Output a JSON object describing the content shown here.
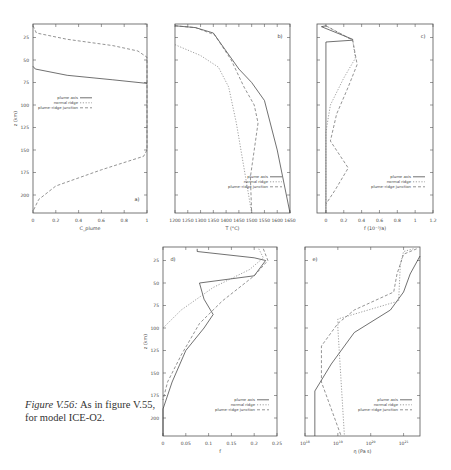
{
  "caption": {
    "label": "Figure V.56:",
    "text": "As in figure V.55, for model ICE-O2."
  },
  "legend": [
    "plume axis",
    "normal ridge",
    "plume–ridge junction"
  ],
  "chart_data": [
    {
      "id": "a",
      "panel_label": "a)",
      "type": "line",
      "xlabel": "C_plume",
      "ylabel": "z (km)",
      "xlim": [
        0,
        1
      ],
      "ylim": [
        10,
        220
      ],
      "y_inverted": true,
      "xticks": [
        "0",
        "0.2",
        "0.4",
        "0.6",
        "0.8",
        "1"
      ],
      "yticks": [
        "25",
        "50",
        "75",
        "100",
        "125",
        "150",
        "175",
        "200"
      ],
      "series": [
        {
          "name": "plume axis",
          "style": "solid",
          "points": [
            [
              0,
              57
            ],
            [
              0.02,
              60
            ],
            [
              0.3,
              67
            ],
            [
              0.7,
              72
            ],
            [
              1,
              76
            ]
          ]
        },
        {
          "name": "normal ridge",
          "style": "dotted",
          "points": [
            [
              0.98,
              0
            ],
            [
              1,
              0
            ]
          ]
        },
        {
          "name": "plume–ridge junction",
          "style": "dashed",
          "points": [
            [
              0,
              12
            ],
            [
              0.03,
              20
            ],
            [
              0.3,
              27
            ],
            [
              0.7,
              34
            ],
            [
              0.92,
              40
            ],
            [
              1,
              47
            ],
            [
              1,
              150
            ],
            [
              0.97,
              157
            ],
            [
              0.6,
              172
            ],
            [
              0.2,
              190
            ],
            [
              0.05,
              205
            ],
            [
              0,
              218
            ]
          ]
        }
      ]
    },
    {
      "id": "b",
      "panel_label": "b)",
      "type": "line",
      "xlabel": "T (°C)",
      "ylabel": "",
      "xlim": [
        1200,
        1650
      ],
      "ylim": [
        10,
        220
      ],
      "y_inverted": true,
      "xticks": [
        "1200",
        "1250",
        "1300",
        "1350",
        "1400",
        "1450",
        "1500",
        "1550",
        "1600",
        "1650"
      ],
      "series": [
        {
          "name": "plume axis",
          "style": "solid",
          "points": [
            [
              1200,
              12
            ],
            [
              1280,
              14
            ],
            [
              1350,
              20
            ],
            [
              1400,
              40
            ],
            [
              1450,
              60
            ],
            [
              1500,
              75
            ],
            [
              1550,
              95
            ],
            [
              1600,
              150
            ],
            [
              1650,
              220
            ]
          ]
        },
        {
          "name": "normal ridge",
          "style": "dotted",
          "points": [
            [
              1200,
              33
            ],
            [
              1300,
              45
            ],
            [
              1370,
              58
            ],
            [
              1410,
              80
            ],
            [
              1440,
              120
            ],
            [
              1470,
              170
            ],
            [
              1500,
              220
            ]
          ]
        },
        {
          "name": "plume–ridge junction",
          "style": "dashed",
          "points": [
            [
              1200,
              12
            ],
            [
              1280,
              14
            ],
            [
              1355,
              22
            ],
            [
              1420,
              50
            ],
            [
              1470,
              80
            ],
            [
              1510,
              100
            ],
            [
              1525,
              120
            ],
            [
              1510,
              150
            ],
            [
              1495,
              180
            ],
            [
              1500,
              220
            ]
          ]
        }
      ]
    },
    {
      "id": "c",
      "panel_label": "c)",
      "type": "line",
      "xlabel": "f (10⁻³/a)",
      "ylabel": "",
      "xlim": [
        -0.1,
        1.2
      ],
      "ylim": [
        10,
        220
      ],
      "y_inverted": true,
      "xticks": [
        "0",
        "0.2",
        "0.4",
        "0.6",
        "0.8",
        "1",
        "1.2"
      ],
      "series": [
        {
          "name": "plume axis",
          "style": "solid",
          "points": [
            [
              0,
              12
            ],
            [
              -0.05,
              13
            ],
            [
              0.3,
              27
            ],
            [
              0.3,
              28
            ],
            [
              0,
              30
            ],
            [
              0,
              220
            ]
          ]
        },
        {
          "name": "normal ridge",
          "style": "dotted",
          "points": [
            [
              0,
              12
            ],
            [
              0.3,
              28
            ],
            [
              0.33,
              48
            ],
            [
              0.2,
              70
            ],
            [
              0.05,
              100
            ],
            [
              0,
              130
            ],
            [
              0,
              220
            ]
          ]
        },
        {
          "name": "plume–ridge junction",
          "style": "dashed",
          "points": [
            [
              0,
              12
            ],
            [
              0.3,
              28
            ],
            [
              0.35,
              55
            ],
            [
              0.25,
              80
            ],
            [
              0.12,
              110
            ],
            [
              0.05,
              140
            ],
            [
              0.25,
              170
            ],
            [
              0.1,
              195
            ],
            [
              0,
              210
            ]
          ]
        }
      ]
    },
    {
      "id": "d",
      "panel_label": "d)",
      "type": "line",
      "xlabel": "f",
      "ylabel": "z (km)",
      "xlim": [
        0,
        0.25
      ],
      "ylim": [
        10,
        220
      ],
      "y_inverted": true,
      "xticks": [
        "0",
        "0.05",
        "0.1",
        "0.15",
        "0.2",
        "0.25"
      ],
      "yticks": [
        "25",
        "50",
        "75",
        "100",
        "125",
        "150",
        "175",
        "200"
      ],
      "series": [
        {
          "name": "plume axis",
          "style": "solid",
          "points": [
            [
              0.075,
              12
            ],
            [
              0.075,
              15
            ],
            [
              0.2,
              22
            ],
            [
              0.225,
              25
            ],
            [
              0.2,
              42
            ],
            [
              0.08,
              50
            ],
            [
              0.09,
              68
            ],
            [
              0.11,
              85
            ],
            [
              0.09,
              100
            ],
            [
              0.05,
              125
            ],
            [
              0.02,
              160
            ],
            [
              0,
              190
            ],
            [
              0,
              220
            ]
          ]
        },
        {
          "name": "normal ridge",
          "style": "dotted",
          "points": [
            [
              0.21,
              12
            ],
            [
              0.22,
              22
            ],
            [
              0.19,
              35
            ],
            [
              0.11,
              55
            ],
            [
              0.04,
              80
            ],
            [
              0,
              100
            ]
          ]
        },
        {
          "name": "plume–ridge junction",
          "style": "dashed",
          "points": [
            [
              0.22,
              12
            ],
            [
              0.23,
              25
            ],
            [
              0.2,
              42
            ],
            [
              0.13,
              70
            ],
            [
              0.08,
              95
            ],
            [
              0.04,
              130
            ],
            [
              0.01,
              160
            ],
            [
              0,
              180
            ]
          ]
        }
      ]
    },
    {
      "id": "e",
      "panel_label": "e)",
      "type": "line",
      "xlabel": "η (Pa s)",
      "ylabel": "",
      "x_scale": "log",
      "xlim": [
        "10^18",
        "10^21.5"
      ],
      "ylim": [
        10,
        220
      ],
      "y_inverted": true,
      "xticks": [
        "10^18",
        "10^19",
        "10^20",
        "10^21"
      ],
      "series": [
        {
          "name": "plume axis",
          "style": "solid",
          "points": [
            [
              21.5,
              20
            ],
            [
              21.2,
              40
            ],
            [
              21,
              60
            ],
            [
              20.6,
              80
            ],
            [
              19.5,
              105
            ],
            [
              18.8,
              140
            ],
            [
              18.3,
              170
            ],
            [
              18.3,
              220
            ]
          ]
        },
        {
          "name": "normal ridge",
          "style": "dotted",
          "points": [
            [
              21.3,
              12
            ],
            [
              21,
              15
            ],
            [
              20.9,
              30
            ],
            [
              20.85,
              70
            ],
            [
              19,
              90
            ],
            [
              19,
              100
            ],
            [
              19.2,
              220
            ]
          ]
        },
        {
          "name": "plume–ridge junction",
          "style": "dashed",
          "points": [
            [
              21.4,
              12
            ],
            [
              21,
              18
            ],
            [
              20.8,
              40
            ],
            [
              20.7,
              60
            ],
            [
              19.5,
              80
            ],
            [
              19,
              95
            ],
            [
              18.5,
              120
            ],
            [
              18.5,
              160
            ],
            [
              18.8,
              190
            ],
            [
              19.1,
              220
            ]
          ]
        }
      ]
    }
  ]
}
